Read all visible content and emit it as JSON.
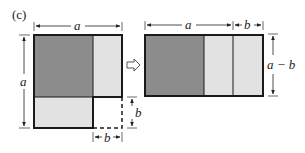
{
  "panel_label": "(c)",
  "left_figure": {
    "top_dimension": "a",
    "left_dimension": "a",
    "right_dimension": "b",
    "bottom_dimension": "b"
  },
  "arrow": "transform-arrow",
  "right_figure": {
    "top_dimension_a": "a",
    "top_dimension_b": "b",
    "right_dimension": "a − b"
  },
  "colors": {
    "dark_fill": "#8c8c8c",
    "light_fill": "#e2e2e2",
    "outline": "#1a1a1a"
  }
}
